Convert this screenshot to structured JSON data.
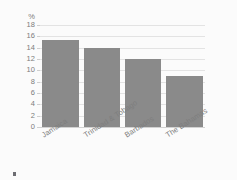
{
  "chart_data": {
    "type": "bar",
    "title": "",
    "subtitle": "",
    "xlabel": "",
    "ylabel": "%",
    "unit_label": "%",
    "categories": [
      "Jamaica",
      "Trinidad & Tobago",
      "Barbados",
      "The Bahamas"
    ],
    "values": [
      15.3,
      14.0,
      12.0,
      9.0
    ],
    "series": [
      {
        "name": "",
        "values": [
          15.3,
          14.0,
          12.0,
          9.0
        ]
      }
    ],
    "ylim": [
      0,
      18
    ],
    "y_tick_step": 2,
    "y_ticks": [
      0,
      2,
      4,
      6,
      8,
      10,
      12,
      14,
      16,
      18
    ],
    "y_tick_labels": [
      "0",
      "2",
      "4",
      "6",
      "8",
      "10",
      "12",
      "14",
      "16",
      "18"
    ],
    "grid": true,
    "grid_axis": "y",
    "legend": false,
    "legend_position": "none",
    "x_tick_rotation": -33,
    "bar_color": "#8a8a8a",
    "grid_color": "#e3e3e3",
    "axis_text_color": "#7b7b7b",
    "background_color": "#fbfbfb"
  }
}
